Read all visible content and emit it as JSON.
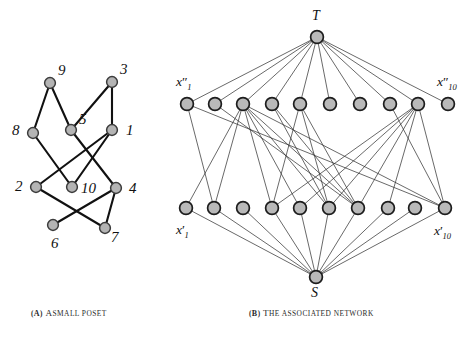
{
  "figure": {
    "subfigures": [
      {
        "tag": "(a)",
        "caption_lead": "A",
        "caption_rest": "SMALL POSET",
        "caption_full": "(a) A small poset"
      },
      {
        "tag": "(b)",
        "caption_lead": "T",
        "caption_rest": "HE ASSOCIATED NETWORK",
        "caption_full": "(b) The associated network"
      }
    ]
  },
  "poset": {
    "type": "hasse-diagram",
    "nodes": [
      {
        "id": "9",
        "label": "9",
        "x": 50,
        "y": 83,
        "label_x": 58,
        "label_y": 62,
        "rank": 0
      },
      {
        "id": "3",
        "label": "3",
        "x": 112,
        "y": 82,
        "label_x": 120,
        "label_y": 61,
        "rank": 0
      },
      {
        "id": "8",
        "label": "8",
        "x": 33,
        "y": 133,
        "label_x": 12,
        "label_y": 122,
        "rank": 1
      },
      {
        "id": "5",
        "label": "5",
        "x": 71,
        "y": 130,
        "label_x": 79,
        "label_y": 111,
        "rank": 1
      },
      {
        "id": "1",
        "label": "1",
        "x": 112,
        "y": 130,
        "label_x": 126,
        "label_y": 122,
        "rank": 1
      },
      {
        "id": "2",
        "label": "2",
        "x": 36,
        "y": 187,
        "label_x": 15,
        "label_y": 178,
        "rank": 2
      },
      {
        "id": "10",
        "label": "10",
        "x": 72,
        "y": 187,
        "label_x": 81,
        "label_y": 180,
        "rank": 2
      },
      {
        "id": "4",
        "label": "4",
        "x": 116,
        "y": 188,
        "label_x": 129,
        "label_y": 180,
        "rank": 2
      },
      {
        "id": "6",
        "label": "6",
        "x": 53,
        "y": 225,
        "label_x": 51,
        "label_y": 235,
        "rank": 3
      },
      {
        "id": "7",
        "label": "7",
        "x": 105,
        "y": 228,
        "label_x": 111,
        "label_y": 229,
        "rank": 3
      }
    ],
    "edges": [
      [
        "9",
        "8"
      ],
      [
        "9",
        "5"
      ],
      [
        "3",
        "5"
      ],
      [
        "3",
        "1"
      ],
      [
        "8",
        "10"
      ],
      [
        "5",
        "4"
      ],
      [
        "1",
        "2"
      ],
      [
        "1",
        "10"
      ],
      [
        "2",
        "7"
      ],
      [
        "4",
        "6"
      ],
      [
        "4",
        "7"
      ]
    ],
    "node_radius": 5.4,
    "node_fill": "#b4b4b4",
    "node_stroke": "#3c3c3c",
    "edge_color": "#111111",
    "edge_width": 2.1
  },
  "network": {
    "type": "bipartite-flow-network",
    "source": {
      "id": "S",
      "label": "S",
      "x": 316,
      "y": 277,
      "label_x": 311,
      "label_y": 285
    },
    "sink": {
      "id": "T",
      "label": "T",
      "x": 317,
      "y": 37,
      "label_x": 312,
      "label_y": 8
    },
    "upper_row": {
      "y": 104,
      "prefix": "x",
      "prime": "″",
      "first_label": "x″₁",
      "last_label": "x″₁₀",
      "first_label_x": 176,
      "first_label_y": 74,
      "last_label_x": 437,
      "last_label_y": 74,
      "indices": [
        1,
        2,
        3,
        4,
        5,
        6,
        7,
        8,
        9,
        10
      ],
      "xs": [
        187,
        215,
        243,
        272,
        300,
        330,
        360,
        390,
        418,
        448
      ]
    },
    "lower_row": {
      "y": 208,
      "prefix": "x",
      "prime": "′",
      "first_label": "x′₁",
      "last_label": "x′₁₀",
      "first_label_x": 176,
      "first_label_y": 222,
      "last_label_x": 434,
      "last_label_y": 223,
      "indices": [
        1,
        2,
        3,
        4,
        5,
        6,
        7,
        8,
        9,
        10
      ],
      "xs": [
        186,
        214,
        243,
        272,
        300,
        329,
        358,
        388,
        415,
        445
      ]
    },
    "middle_edges": [
      [
        1,
        2
      ],
      [
        1,
        10
      ],
      [
        3,
        5
      ],
      [
        3,
        1
      ],
      [
        3,
        4
      ],
      [
        3,
        2
      ],
      [
        3,
        10
      ],
      [
        3,
        6
      ],
      [
        3,
        7
      ],
      [
        4,
        6
      ],
      [
        4,
        7
      ],
      [
        5,
        4
      ],
      [
        5,
        6
      ],
      [
        5,
        7
      ],
      [
        9,
        8
      ],
      [
        9,
        5
      ],
      [
        9,
        10
      ],
      [
        9,
        4
      ],
      [
        9,
        6
      ],
      [
        9,
        7
      ],
      [
        2,
        7
      ],
      [
        8,
        10
      ]
    ],
    "node_radius": 6.4,
    "node_fill": "#b9b9b9",
    "node_stroke": "#1d1d1d",
    "edge_color": "#2e2e2e",
    "edge_width": 0.72
  }
}
